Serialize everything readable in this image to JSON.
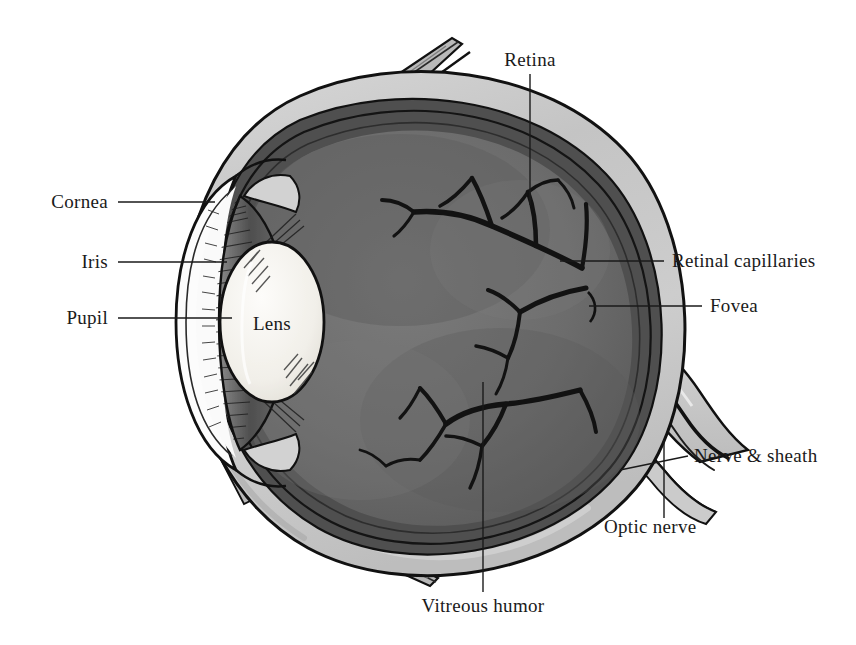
{
  "figure": {
    "background_color": "#ffffff",
    "ink_color": "#1a1a1a",
    "palette": {
      "sclera": "#c6c6c6",
      "sclera_highlight": "#e4e4e4",
      "vitreous": "#6e6e6e",
      "vitreous_dark": "#5a5a5a",
      "choroid": "#4a4a4a",
      "iris": "#5c5c5c",
      "lens": "#f2f0ec",
      "aqueous": "#fbfbfb",
      "nerve_sheath": "#cfcfcf",
      "vessel": "#141414",
      "outline": "#111111"
    }
  },
  "labels": [
    {
      "id": "retina",
      "text": "Retina",
      "side": "center",
      "x": 530,
      "y": 60,
      "leader": [
        [
          530,
          74
        ],
        [
          530,
          205
        ]
      ]
    },
    {
      "id": "cornea",
      "text": "Cornea",
      "side": "left",
      "x": 108,
      "y": 202,
      "leader": [
        [
          118,
          202
        ],
        [
          215,
          202
        ]
      ]
    },
    {
      "id": "iris",
      "text": "Iris",
      "side": "left",
      "x": 108,
      "y": 262,
      "leader": [
        [
          118,
          262
        ],
        [
          227,
          262
        ]
      ]
    },
    {
      "id": "pupil",
      "text": "Pupil",
      "side": "left",
      "x": 108,
      "y": 318,
      "leader": [
        [
          118,
          318
        ],
        [
          232,
          318
        ]
      ]
    },
    {
      "id": "lens",
      "text": "Lens",
      "side": "center",
      "x": 272,
      "y": 324,
      "leader": []
    },
    {
      "id": "retinal-capillaries",
      "text": "Retinal capillaries",
      "side": "right",
      "x": 672,
      "y": 261,
      "leader": [
        [
          560,
          261
        ],
        [
          664,
          261
        ]
      ]
    },
    {
      "id": "fovea",
      "text": "Fovea",
      "side": "right",
      "x": 710,
      "y": 306,
      "leader": [
        [
          589,
          306
        ],
        [
          702,
          306
        ]
      ]
    },
    {
      "id": "nerve-sheath",
      "text": "Nerve & sheath",
      "side": "right",
      "x": 694,
      "y": 456,
      "leader": [
        [
          620,
          470
        ],
        [
          688,
          456
        ]
      ]
    },
    {
      "id": "optic-nerve",
      "text": "Optic nerve",
      "side": "right",
      "x": 604,
      "y": 527,
      "leader": [
        [
          664,
          518
        ],
        [
          664,
          440
        ]
      ]
    },
    {
      "id": "vitreous-humor",
      "text": "Vitreous humor",
      "side": "center",
      "x": 483,
      "y": 606,
      "leader": [
        [
          483,
          592
        ],
        [
          483,
          382
        ]
      ]
    }
  ],
  "structures": [
    {
      "id": "sclera",
      "name": "Sclera"
    },
    {
      "id": "choroid",
      "name": "Choroid"
    },
    {
      "id": "retina",
      "name": "Retina"
    },
    {
      "id": "vitreous-body",
      "name": "Vitreous humor"
    },
    {
      "id": "cornea",
      "name": "Cornea"
    },
    {
      "id": "anterior-chamber",
      "name": "Anterior chamber (aqueous humor)"
    },
    {
      "id": "iris",
      "name": "Iris"
    },
    {
      "id": "pupil",
      "name": "Pupil"
    },
    {
      "id": "lens",
      "name": "Lens"
    },
    {
      "id": "ciliary-body",
      "name": "Ciliary body"
    },
    {
      "id": "optic-nerve",
      "name": "Optic nerve"
    },
    {
      "id": "nerve-sheath",
      "name": "Nerve sheath"
    },
    {
      "id": "fovea",
      "name": "Fovea"
    },
    {
      "id": "retinal-capillaries",
      "name": "Retinal capillaries"
    },
    {
      "id": "muscle-stub-top",
      "name": "Extraocular muscle tendon (superior)"
    },
    {
      "id": "muscle-stub-bottom",
      "name": "Extraocular muscle tendon (inferior)"
    }
  ]
}
